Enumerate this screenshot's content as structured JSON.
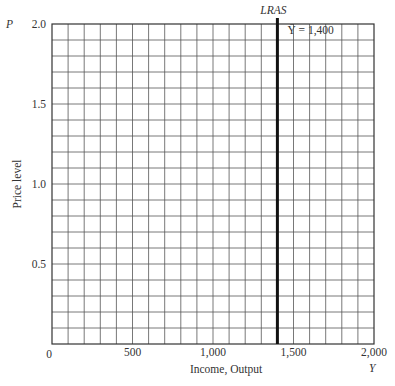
{
  "chart_data": {
    "type": "line",
    "title": "",
    "xlabel": "Income, Output",
    "ylabel": "Price level",
    "x_axis_symbol": "Y",
    "y_axis_symbol": "P",
    "xlim": [
      0,
      2000
    ],
    "ylim": [
      0,
      2.0
    ],
    "x_ticks": [
      0,
      500,
      1000,
      1500,
      2000
    ],
    "x_tick_labels": [
      "0",
      "500",
      "1,000",
      "1,500",
      "2,000"
    ],
    "y_ticks": [
      0.5,
      1.0,
      1.5,
      2.0
    ],
    "y_tick_labels": [
      "0.5",
      "1.0",
      "1.5",
      "2.0"
    ],
    "grid": true,
    "grid_x_step": 100,
    "grid_y_step": 0.1,
    "series": [
      {
        "name": "LRAS",
        "type": "vertical-line",
        "x": [
          1400,
          1400
        ],
        "y": [
          0,
          2.0
        ],
        "annotation": "Ȳ = 1,400",
        "color": "#111111"
      }
    ]
  }
}
